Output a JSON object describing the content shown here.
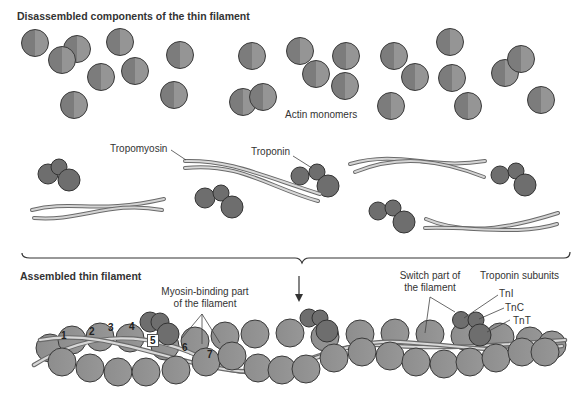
{
  "diagram": {
    "top_section": {
      "title": "Disassembled components of the thin filament",
      "labels": {
        "actin": "Actin monomers",
        "tropomyosin": "Tropomyosin",
        "troponin": "Troponin"
      }
    },
    "bottom_section": {
      "title": "Assembled thin filament",
      "labels": {
        "myosin_binding": [
          "Myosin-binding part",
          "of the filament"
        ],
        "switch": [
          "Switch part of",
          "the filament"
        ],
        "troponin_subunits": "Troponin subunits",
        "tni": "TnI",
        "tnc": "TnC",
        "tnt": "TnT"
      },
      "actin_numbers": [
        "1",
        "2",
        "3",
        "4",
        "5",
        "6",
        "7"
      ]
    },
    "colors": {
      "actin": "#8a8a8a",
      "actin_outline": "#3a3a3a",
      "troponin": "#6e6e6e",
      "tropomyosin_light": "#d8d8d8",
      "tropomyosin_dark": "#7a7a7a",
      "line": "#444444"
    }
  }
}
